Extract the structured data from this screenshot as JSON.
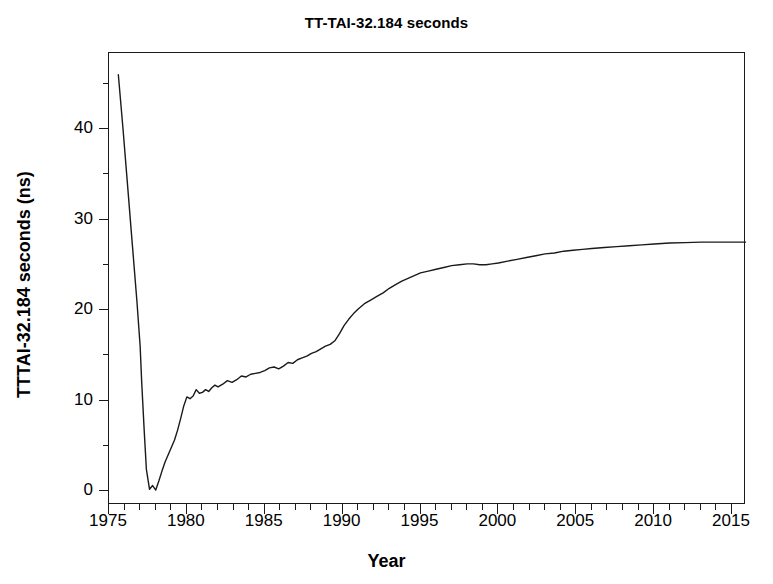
{
  "chart_data": {
    "type": "line",
    "title": "TT-TAI-32.184 seconds",
    "xlabel": "Year",
    "ylabel": "TTTAI-32.184 seconds (ns)",
    "xlim": [
      1975,
      2016
    ],
    "ylim": [
      -2,
      48
    ],
    "grid": false,
    "legend": null,
    "x_major_ticks": [
      1975,
      1980,
      1985,
      1990,
      1995,
      2000,
      2005,
      2010,
      2015
    ],
    "x_tick_labels": [
      "1975",
      "1980",
      "1985",
      "1990",
      "1995",
      "2000",
      "2005",
      "2010",
      "2015"
    ],
    "x_minor_tick_step": 1,
    "y_major_ticks": [
      0,
      10,
      20,
      30,
      40
    ],
    "y_tick_labels": [
      "0",
      "10",
      "20",
      "30",
      "40"
    ],
    "y_minor_tick_step": 5,
    "line_color": "#1a1a1a",
    "line_width": 1.4,
    "series": [
      {
        "name": "TT-TAI-32.184 seconds",
        "x": [
          1975.6,
          1975.9,
          1976.2,
          1976.5,
          1976.8,
          1977.0,
          1977.1,
          1977.25,
          1977.4,
          1977.6,
          1977.8,
          1978.0,
          1978.2,
          1978.4,
          1978.6,
          1978.8,
          1979.0,
          1979.2,
          1979.4,
          1979.6,
          1979.8,
          1980.0,
          1980.2,
          1980.4,
          1980.6,
          1980.8,
          1981.0,
          1981.2,
          1981.4,
          1981.6,
          1981.8,
          1982.0,
          1982.3,
          1982.6,
          1982.9,
          1983.2,
          1983.5,
          1983.8,
          1984.1,
          1984.4,
          1984.7,
          1985.0,
          1985.3,
          1985.6,
          1985.9,
          1986.2,
          1986.5,
          1986.8,
          1987.1,
          1987.4,
          1987.7,
          1988.0,
          1988.3,
          1988.6,
          1988.9,
          1989.2,
          1989.5,
          1989.8,
          1990.1,
          1990.4,
          1990.7,
          1991.0,
          1991.4,
          1991.8,
          1992.2,
          1992.6,
          1993.0,
          1993.4,
          1993.8,
          1994.2,
          1994.6,
          1995.0,
          1995.5,
          1996.0,
          1996.5,
          1997.0,
          1997.5,
          1998.0,
          1998.4,
          1998.8,
          1999.2,
          1999.6,
          2000.0,
          2000.6,
          2001.2,
          2001.8,
          2002.4,
          2003.0,
          2003.6,
          2004.2,
          2004.8,
          2005.4,
          2006.0,
          2006.8,
          2007.6,
          2008.4,
          2009.2,
          2010.0,
          2011.0,
          2012.0,
          2013.0,
          2014.0,
          2015.0,
          2016.0
        ],
        "y": [
          46.0,
          40.0,
          33.6,
          27.2,
          20.8,
          16.0,
          12.0,
          7.0,
          2.4,
          0.2,
          0.6,
          0.1,
          1.1,
          2.2,
          3.2,
          4.0,
          4.8,
          5.6,
          6.7,
          8.0,
          9.4,
          10.4,
          10.2,
          10.5,
          11.2,
          10.8,
          10.9,
          11.2,
          11.0,
          11.4,
          11.7,
          11.5,
          11.8,
          12.2,
          12.0,
          12.3,
          12.7,
          12.6,
          12.9,
          13.0,
          13.1,
          13.3,
          13.6,
          13.7,
          13.5,
          13.8,
          14.2,
          14.1,
          14.5,
          14.7,
          14.9,
          15.2,
          15.4,
          15.7,
          16.0,
          16.2,
          16.6,
          17.4,
          18.3,
          19.0,
          19.6,
          20.1,
          20.7,
          21.1,
          21.5,
          21.9,
          22.4,
          22.8,
          23.2,
          23.5,
          23.8,
          24.1,
          24.3,
          24.5,
          24.7,
          24.9,
          25.0,
          25.1,
          25.1,
          25.0,
          25.0,
          25.1,
          25.2,
          25.4,
          25.6,
          25.8,
          26.0,
          26.2,
          26.3,
          26.5,
          26.6,
          26.7,
          26.8,
          26.9,
          27.0,
          27.1,
          27.2,
          27.3,
          27.4,
          27.45,
          27.5,
          27.5,
          27.5,
          27.5
        ]
      }
    ]
  }
}
